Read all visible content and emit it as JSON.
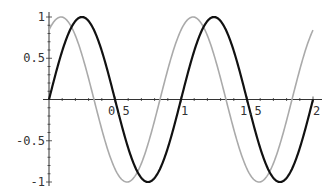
{
  "chart_data": {
    "type": "line",
    "title": "",
    "xlabel": "",
    "ylabel": "",
    "xlim": [
      0,
      2
    ],
    "ylim": [
      -1,
      1
    ],
    "grid": false,
    "legend": null,
    "x_ticks": [
      {
        "value": 0.5,
        "label": "0.5"
      },
      {
        "value": 1,
        "label": "1"
      },
      {
        "value": 1.5,
        "label": "1.5"
      },
      {
        "value": 2,
        "label": "2"
      }
    ],
    "y_ticks": [
      {
        "value": 1,
        "label": "1"
      },
      {
        "value": 0.5,
        "label": "0.5"
      },
      {
        "value": -0.5,
        "label": "-0.5"
      },
      {
        "value": -1,
        "label": "-1"
      }
    ],
    "series": [
      {
        "name": "black-curve",
        "description": "sin(2πx)",
        "color": "#111111",
        "width": 2.2,
        "phase": 0,
        "x": [
          0,
          0.25,
          0.5,
          0.75,
          1.0,
          1.25,
          1.5,
          1.75,
          2.0
        ],
        "values": [
          0,
          1,
          0,
          -1,
          0,
          1,
          0,
          -1,
          0
        ]
      },
      {
        "name": "gray-curve",
        "description": "sin(2πx + 1.0)",
        "color": "#aaaaaa",
        "width": 1.6,
        "phase": 1.0,
        "x": [
          0,
          0.09,
          0.34,
          0.59,
          0.84,
          1.09,
          1.34,
          1.59,
          1.84,
          2.0
        ],
        "values": [
          0.84,
          1,
          0,
          -1,
          0,
          1,
          0,
          -1,
          0,
          0.84
        ]
      }
    ]
  }
}
